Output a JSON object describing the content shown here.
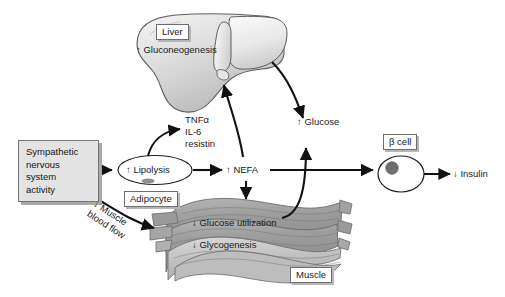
{
  "figure": {
    "background": "#ffffff"
  },
  "nodes": {
    "sns": {
      "label": "Sympathetic\nnervous\nsystem\nactivity",
      "fill": "#e3e3e3",
      "stroke": "#777777"
    },
    "lipolysis": {
      "label": "↑ Lipolysis",
      "sublabel": "Adipocyte"
    },
    "cytokines": {
      "line1": "TNFα",
      "line2": "IL-6",
      "line3": "resistin"
    },
    "nefa": {
      "label": "↑ NEFA"
    },
    "liver": {
      "label": "Liver",
      "process": "↑ Gluconeogenesis",
      "fill": "#d8d8d8"
    },
    "glucose": {
      "label": "↑ Glucose"
    },
    "muscle": {
      "label": "Muscle",
      "process1": "↓ Glucose utilization",
      "process2": "↓ Glycogenesis",
      "fill": "#9b9b9b"
    },
    "bloodflow": {
      "label": "↓ Muscle\nblood flow"
    },
    "betacell": {
      "label": "β cell"
    },
    "insulin": {
      "label": "↓ Insulin"
    }
  },
  "edges": [
    {
      "name": "sns-to-lipolysis",
      "from": "sns",
      "to": "lipolysis",
      "style": "straight"
    },
    {
      "name": "sns-to-muscle",
      "from": "sns",
      "to": "muscle",
      "style": "curved",
      "label": "↓ Muscle blood flow"
    },
    {
      "name": "lipolysis-to-cytokines",
      "from": "lipolysis",
      "to": "cytokines",
      "style": "curved"
    },
    {
      "name": "lipolysis-to-nefa",
      "from": "lipolysis",
      "to": "nefa",
      "style": "straight"
    },
    {
      "name": "nefa-to-liver",
      "from": "nefa",
      "to": "liver",
      "style": "straight"
    },
    {
      "name": "nefa-to-muscle",
      "from": "nefa",
      "to": "muscle",
      "style": "straight"
    },
    {
      "name": "nefa-to-betacell",
      "from": "nefa",
      "to": "betacell",
      "style": "straight"
    },
    {
      "name": "liver-to-glucose",
      "from": "liver",
      "to": "glucose",
      "style": "curved"
    },
    {
      "name": "muscle-to-glucose",
      "from": "muscle",
      "to": "glucose",
      "style": "curved"
    },
    {
      "name": "betacell-to-insulin",
      "from": "betacell",
      "to": "insulin",
      "style": "straight"
    }
  ],
  "colors": {
    "ink": "#1a1a1a",
    "arrow": "#111111",
    "box_fill": "#e3e3e3",
    "box_stroke": "#777777",
    "shadow": "#a9a9a9",
    "liver_light": "#f1f1f1",
    "liver_mid": "#d5d5d5",
    "liver_dark": "#b4b4b4",
    "muscle_light": "#c9c9c9",
    "muscle_mid": "#9d9d9d",
    "muscle_dark": "#8a8a8a"
  }
}
